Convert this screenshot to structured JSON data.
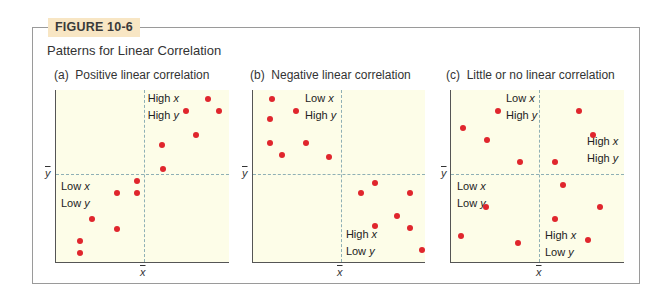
{
  "figure": {
    "badge": "FIGURE 10-6",
    "title": "Patterns for Linear Correlation",
    "colors": {
      "badge_bg": "#f8e6c4",
      "plot_bg": "#fdfde8",
      "point": "#e0262d",
      "mean_line": "#8fb0b5",
      "frame": "#9a9a9a"
    }
  },
  "panels": [
    {
      "title": "(a)  Positive linear correlation",
      "x_mean_label": "x",
      "y_mean_label": "y",
      "quadrant_labels": [
        {
          "line1": "High ",
          "var1": "x",
          "line2": "High ",
          "var2": "y"
        },
        {
          "line1": "Low ",
          "var1": "x",
          "line2": "Low ",
          "var2": "y"
        }
      ]
    },
    {
      "title": "(b)  Negative linear correlation",
      "x_mean_label": "x",
      "y_mean_label": "y",
      "quadrant_labels": [
        {
          "line1": "Low ",
          "var1": "x",
          "line2": "High ",
          "var2": "y"
        },
        {
          "line1": "High ",
          "var1": "x",
          "line2": "Low ",
          "var2": "y"
        }
      ]
    },
    {
      "title": "(c)  Little or no linear correlation",
      "x_mean_label": "x",
      "y_mean_label": "y",
      "quadrant_labels": [
        {
          "line1": "Low ",
          "var1": "x",
          "line2": "High ",
          "var2": "y"
        },
        {
          "line1": "High ",
          "var1": "x",
          "line2": "High ",
          "var2": "y"
        },
        {
          "line1": "Low ",
          "var1": "x",
          "line2": "Low ",
          "var2": "y"
        },
        {
          "line1": "High ",
          "var1": "x",
          "line2": "Low ",
          "var2": "y"
        }
      ]
    }
  ],
  "chart_data": [
    {
      "type": "scatter",
      "title": "(a) Positive linear correlation",
      "xlabel": "x̄",
      "ylabel": "ȳ",
      "xlim": [
        0,
        100
      ],
      "ylim": [
        0,
        100
      ],
      "x_mean": 50.6,
      "y_mean": 51,
      "grid": false,
      "points": [
        [
          88,
          95
        ],
        [
          75,
          88
        ],
        [
          94,
          88
        ],
        [
          81,
          74
        ],
        [
          61,
          68
        ],
        [
          62,
          54
        ],
        [
          47,
          47
        ],
        [
          35,
          40
        ],
        [
          47,
          40
        ],
        [
          21,
          25
        ],
        [
          35,
          19
        ],
        [
          14,
          12
        ],
        [
          14,
          5
        ]
      ],
      "annotations": [
        "High x / High y (upper right)",
        "Low x / Low y (lower left)"
      ]
    },
    {
      "type": "scatter",
      "title": "(b) Negative linear correlation",
      "xlabel": "x̄",
      "ylabel": "ȳ",
      "xlim": [
        0,
        100
      ],
      "ylim": [
        0,
        100
      ],
      "x_mean": 50.9,
      "y_mean": 51,
      "points": [
        [
          11,
          95
        ],
        [
          25,
          88
        ],
        [
          10,
          83
        ],
        [
          10,
          69
        ],
        [
          31,
          69
        ],
        [
          17,
          62
        ],
        [
          44,
          61
        ],
        [
          71,
          46
        ],
        [
          63,
          40
        ],
        [
          91,
          40
        ],
        [
          84,
          27
        ],
        [
          71,
          21
        ],
        [
          91,
          20
        ],
        [
          98,
          7
        ]
      ],
      "annotations": [
        "Low x / High y (upper left)",
        "High x / Low y (lower right)"
      ]
    },
    {
      "type": "scatter",
      "title": "(c) Little or no linear correlation",
      "xlabel": "x̄",
      "ylabel": "ȳ",
      "xlim": [
        0,
        100
      ],
      "ylim": [
        0,
        100
      ],
      "x_mean": 51,
      "y_mean": 51,
      "points": [
        [
          27,
          88
        ],
        [
          74,
          88
        ],
        [
          7,
          78
        ],
        [
          21,
          71
        ],
        [
          82,
          74
        ],
        [
          40,
          58
        ],
        [
          60,
          58
        ],
        [
          65,
          45
        ],
        [
          86,
          32
        ],
        [
          20,
          32
        ],
        [
          60,
          25
        ],
        [
          6,
          15
        ],
        [
          39,
          11
        ],
        [
          79,
          13
        ]
      ],
      "annotations": [
        "Low x / High y",
        "High x / High y",
        "Low x / Low y",
        "High x / Low y"
      ]
    }
  ]
}
